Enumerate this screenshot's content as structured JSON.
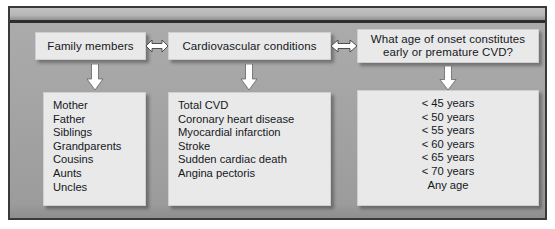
{
  "figure": {
    "columns": [
      {
        "id": "family-members",
        "header": "Family members",
        "items": [
          "Mother",
          "Father",
          "Siblings",
          "Grandparents",
          "Cousins",
          "Aunts",
          "Uncles"
        ]
      },
      {
        "id": "cardiovascular-conditions",
        "header": "Cardiovascular conditions",
        "items": [
          "Total CVD",
          "Coronary heart disease",
          "Myocardial infarction",
          "Stroke",
          "Sudden cardiac death",
          "Angina pectoris"
        ]
      },
      {
        "id": "age-of-onset",
        "header_line1": "What age of onset constitutes",
        "header_line2": "early or premature CVD?",
        "items": [
          "< 45 years",
          "< 50 years",
          "< 55 years",
          "< 60 years",
          "< 65 years",
          "< 70 years",
          "Any age"
        ]
      }
    ],
    "connectors": [
      {
        "id": "family-to-cardio",
        "icon": "double-headed-horizontal-arrow"
      },
      {
        "id": "cardio-to-age",
        "icon": "double-headed-horizontal-arrow"
      },
      {
        "id": "family-header-to-list",
        "icon": "down-arrow"
      },
      {
        "id": "cardio-header-to-list",
        "icon": "down-arrow"
      },
      {
        "id": "age-header-to-list",
        "icon": "down-arrow"
      }
    ],
    "colors": {
      "panel_background": "#a5a5a5",
      "box_fill": "#e9e9e9",
      "frame_border": "#3a3a3a",
      "text": "#14181d",
      "arrow_fill": "#ffffff",
      "arrow_stroke": "#3f3f3f"
    }
  }
}
